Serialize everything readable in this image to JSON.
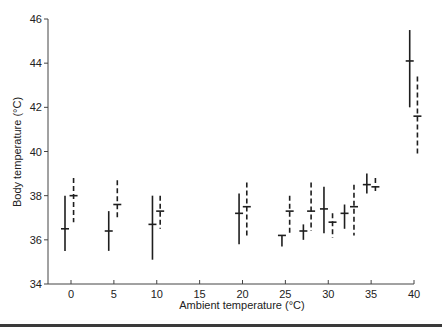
{
  "chart_data": {
    "type": "scatter",
    "title": "",
    "xlabel": "Ambient temperature (°C)",
    "ylabel": "Body temperature (°C)",
    "xlim": [
      0,
      40
    ],
    "ylim": [
      34,
      46
    ],
    "x_ticks": [
      0,
      5,
      10,
      15,
      20,
      25,
      30,
      35,
      40
    ],
    "y_ticks": [
      34,
      36,
      38,
      40,
      42,
      44,
      46
    ],
    "grid": false,
    "legend": null,
    "series": [
      {
        "name": "solid",
        "line_style": "solid",
        "points": [
          {
            "x": -0.7,
            "mean": 36.5,
            "low": 35.5,
            "high": 38.0
          },
          {
            "x": 4.4,
            "mean": 36.4,
            "low": 35.5,
            "high": 37.3
          },
          {
            "x": 9.5,
            "mean": 36.7,
            "low": 35.1,
            "high": 38.0
          },
          {
            "x": 19.6,
            "mean": 37.2,
            "low": 35.8,
            "high": 38.1
          },
          {
            "x": 24.6,
            "mean": 36.2,
            "low": 35.7,
            "high": 36.2
          },
          {
            "x": 27.1,
            "mean": 36.4,
            "low": 36.0,
            "high": 36.7
          },
          {
            "x": 29.5,
            "mean": 37.4,
            "low": 36.3,
            "high": 38.4
          },
          {
            "x": 31.9,
            "mean": 37.2,
            "low": 36.5,
            "high": 37.6
          },
          {
            "x": 34.5,
            "mean": 38.5,
            "low": 38.1,
            "high": 39.0
          },
          {
            "x": 39.5,
            "mean": 44.1,
            "low": 42.0,
            "high": 45.5
          }
        ]
      },
      {
        "name": "dashed",
        "line_style": "dashed",
        "points": [
          {
            "x": 0.3,
            "mean": 38.0,
            "low": 36.8,
            "high": 38.8
          },
          {
            "x": 5.4,
            "mean": 37.6,
            "low": 36.9,
            "high": 38.7
          },
          {
            "x": 10.4,
            "mean": 37.3,
            "low": 36.5,
            "high": 38.0
          },
          {
            "x": 20.5,
            "mean": 37.5,
            "low": 36.1,
            "high": 38.6
          },
          {
            "x": 25.5,
            "mean": 37.3,
            "low": 36.3,
            "high": 38.0
          },
          {
            "x": 28.0,
            "mean": 37.3,
            "low": 36.4,
            "high": 38.6
          },
          {
            "x": 30.5,
            "mean": 36.8,
            "low": 36.1,
            "high": 37.2
          },
          {
            "x": 33.0,
            "mean": 37.5,
            "low": 36.2,
            "high": 38.5
          },
          {
            "x": 35.5,
            "mean": 38.4,
            "low": 38.2,
            "high": 38.8
          },
          {
            "x": 40.4,
            "mean": 41.6,
            "low": 39.8,
            "high": 43.4
          }
        ]
      }
    ]
  },
  "axes": {
    "x_title": "Ambient temperature (°C)",
    "y_title": "Body temperature (°C)"
  },
  "style": {
    "ink": "#1e1e1e",
    "axis": "#444444",
    "background": "#ffffff"
  }
}
